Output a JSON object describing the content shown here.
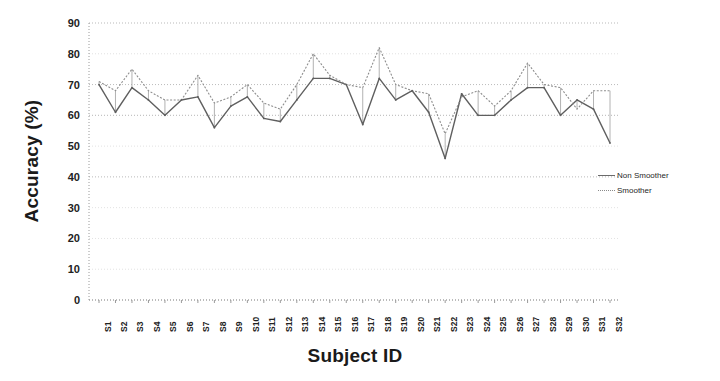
{
  "chart_data": {
    "type": "line",
    "title": "",
    "xlabel": "Subject ID",
    "ylabel": "Accuracy (%)",
    "ylim": [
      0,
      90
    ],
    "ytick_step": 10,
    "yticks": [
      90,
      80,
      70,
      60,
      50,
      40,
      30,
      20,
      10,
      0
    ],
    "grid": true,
    "legend_position": "right",
    "categories": [
      "S1",
      "S2",
      "S3",
      "S4",
      "S5",
      "S6",
      "S7",
      "S8",
      "S9",
      "S10",
      "S11",
      "S12",
      "S13",
      "S14",
      "S15",
      "S16",
      "S17",
      "S18",
      "S19",
      "S20",
      "S21",
      "S22",
      "S23",
      "S24",
      "S25",
      "S26",
      "S27",
      "S28",
      "S29",
      "S30",
      "S31",
      "S32"
    ],
    "series": [
      {
        "name": "Non Smoother",
        "style": "solid",
        "color": "#5f5f5f",
        "values": [
          70,
          61,
          69,
          65,
          60,
          65,
          66,
          56,
          63,
          66,
          59,
          58,
          65,
          72,
          72,
          70,
          57,
          72,
          65,
          68,
          61,
          46,
          67,
          60,
          60,
          65,
          69,
          69,
          60,
          65,
          62,
          51
        ]
      },
      {
        "name": "Smoother",
        "style": "dotted",
        "color": "#8d8d8d",
        "values": [
          71,
          68,
          75,
          68,
          65,
          65,
          73,
          64,
          66,
          70,
          64,
          62,
          70,
          80,
          73,
          70,
          69,
          82,
          70,
          68,
          67,
          54,
          66,
          68,
          63,
          68,
          77,
          70,
          69,
          62,
          68,
          68
        ]
      }
    ]
  },
  "legend": {
    "items": [
      {
        "label": "Non Smoother"
      },
      {
        "label": "Smoother"
      }
    ]
  }
}
